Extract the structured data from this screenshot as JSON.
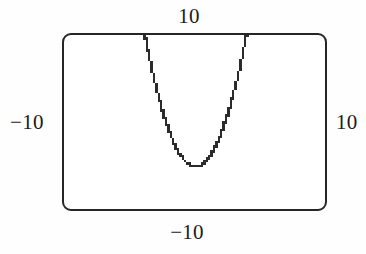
{
  "figure": {
    "kind": "graphing-calculator-viewport",
    "frame": {
      "border_color": "#262626",
      "background_color": "#ffffff",
      "corner_radius_px": 9
    },
    "labels": {
      "top": "10",
      "bottom": "−10",
      "left": "−10",
      "right": "10"
    }
  },
  "chart_data": {
    "type": "line",
    "title": "",
    "xlabel": "",
    "ylabel": "",
    "xlim": [
      -10,
      10
    ],
    "ylim": [
      -10,
      10
    ],
    "grid": false,
    "legend": null,
    "axis_tick_labels": {
      "top": "10",
      "bottom": "-10",
      "left": "-10",
      "right": "10"
    },
    "annotations": [],
    "series": [
      {
        "name": "parabola",
        "style": "pixelated-stairstep",
        "color": "#2b2b2b",
        "x": [
          -3.15,
          -3.0,
          -2.8,
          -2.6,
          -2.4,
          -2.2,
          -2.0,
          -1.8,
          -1.6,
          -1.4,
          -1.2,
          -1.0,
          -0.8,
          -0.6,
          -0.4,
          -0.2,
          0.0,
          0.2,
          0.4,
          0.6,
          0.8,
          1.0,
          1.2,
          1.4,
          1.6,
          1.8,
          2.0,
          2.2,
          2.4,
          2.6,
          2.8,
          3.0,
          3.2
        ],
        "y": [
          9.92,
          9.0,
          7.84,
          6.76,
          5.76,
          4.84,
          4.0,
          3.24,
          2.56,
          1.96,
          1.44,
          1.0,
          0.64,
          0.36,
          0.16,
          0.04,
          0.0,
          0.04,
          0.16,
          0.36,
          0.64,
          1.0,
          1.44,
          1.96,
          2.56,
          3.24,
          4.0,
          4.84,
          5.76,
          6.76,
          7.84,
          9.0,
          10.24
        ],
        "vertex": [
          0,
          0
        ],
        "equation": "y = x^2"
      }
    ]
  }
}
